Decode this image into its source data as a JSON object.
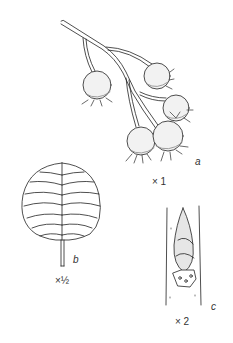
{
  "figure": {
    "panels": [
      {
        "id": "a",
        "letter": "a",
        "scale": "× 1",
        "subject": "fruiting branch"
      },
      {
        "id": "b",
        "letter": "b",
        "scale": "×½",
        "subject": "leaf"
      },
      {
        "id": "c",
        "letter": "c",
        "scale": "× 2",
        "subject": "bud on twig"
      }
    ]
  },
  "colors": {
    "ink": "#222222",
    "background": "#ffffff"
  }
}
